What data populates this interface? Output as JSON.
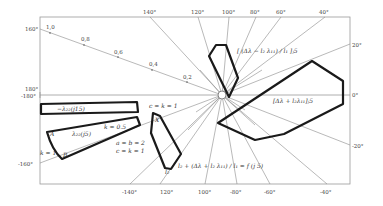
{
  "diagram": {
    "type": "smith-like radial chart with admittance regions",
    "axis_top_labels": [
      "140°",
      "120°",
      "100°",
      "80°",
      "60°",
      "40°"
    ],
    "axis_bottom_labels": [
      "-140°",
      "120°",
      "100°",
      "-80°",
      "-60°",
      "-40°"
    ],
    "axis_left_labels": [
      "160°",
      "180°",
      "-180°",
      "-160°"
    ],
    "axis_right_labels": [
      "20°",
      "0°",
      "-20°"
    ],
    "radial_scale_labels": [
      "1,0",
      "0,8",
      "0,6",
      "0,4",
      "0,2"
    ],
    "region_labels": {
      "upper_polygon": "[ (Δλ − l₂ λ₁₁) / l₁ ]ⱼ5",
      "right_polygon": "[Δλ + l₂λ₁₁]ⱼ5",
      "lower_middle_polygon": "l₂ + (Δλ + l₂ λ₁₁) / l₁ = f (j 5)",
      "left_top_band": "−λ₂₂(j15)",
      "left_lower_band": "λ₂₂(j5)",
      "k_half": "k = 0.5",
      "k_one": "k = 1",
      "point_A": "A",
      "point_B": "B",
      "point_X": "X",
      "c_eq": "c = k = 1",
      "a_eq": "a = b = 2",
      "c_eq2": "c = k = 1",
      "l_label": "l",
      "l_prime": "l₂"
    }
  }
}
